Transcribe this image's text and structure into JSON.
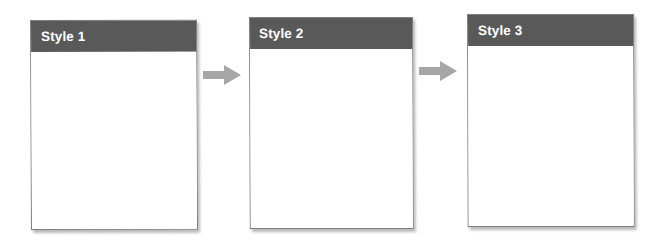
{
  "diagram": {
    "background_color": "#ffffff",
    "header_color": "#595959",
    "header_text_color": "#ffffff",
    "card_border_color": "#7f7f7f",
    "card_body_color": "#ffffff",
    "arrow_color": "#a6a6a6",
    "cards": [
      {
        "title": "Style 1",
        "body_text": ""
      },
      {
        "title": "Style 2",
        "body_text": ""
      },
      {
        "title": "Style 3",
        "body_text": ""
      }
    ],
    "connectors": [
      {
        "name": "arrow-right-icon",
        "from": "Style 1",
        "to": "Style 2",
        "direction": "right"
      },
      {
        "name": "arrow-right-icon",
        "from": "Style 2",
        "to": "Style 3",
        "direction": "right"
      }
    ]
  }
}
